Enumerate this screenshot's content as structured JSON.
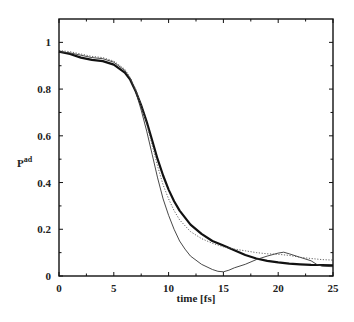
{
  "chart_data": {
    "type": "line",
    "title": "",
    "xlabel": "time [fs]",
    "ylabel": "P",
    "ylabel_superscript": "ad",
    "xlim": [
      0,
      25
    ],
    "ylim": [
      0,
      1.1
    ],
    "xticks": [
      0,
      5,
      10,
      15,
      20,
      25
    ],
    "yticks": [
      0,
      0.2,
      0.4,
      0.6,
      0.8,
      1
    ],
    "xtick_labels": [
      "0",
      "5",
      "10",
      "15",
      "20",
      "25"
    ],
    "ytick_labels": [
      "0",
      "0.2",
      "0.4",
      "0.6",
      "0.8",
      "1"
    ],
    "grid": false,
    "legend": null,
    "series": [
      {
        "name": "thick-solid",
        "style": "solid",
        "width": 2.2,
        "color": "#111111",
        "x": [
          0,
          1,
          2,
          3,
          4,
          5,
          6,
          6.5,
          7,
          7.5,
          8,
          8.5,
          9,
          9.5,
          10,
          10.5,
          11,
          12,
          13,
          14,
          15,
          16,
          17,
          18,
          19,
          20,
          21,
          22,
          23,
          24,
          25
        ],
        "y": [
          0.96,
          0.95,
          0.935,
          0.925,
          0.92,
          0.905,
          0.87,
          0.84,
          0.79,
          0.73,
          0.66,
          0.58,
          0.5,
          0.43,
          0.37,
          0.32,
          0.28,
          0.22,
          0.18,
          0.15,
          0.13,
          0.11,
          0.09,
          0.075,
          0.065,
          0.058,
          0.053,
          0.05,
          0.048,
          0.047,
          0.046
        ]
      },
      {
        "name": "thin-solid",
        "style": "solid",
        "width": 0.9,
        "color": "#333333",
        "x": [
          0,
          1,
          2,
          3,
          4,
          5,
          6,
          6.5,
          7,
          7.5,
          8,
          8.5,
          9,
          9.5,
          10,
          10.5,
          11,
          11.5,
          12,
          13,
          14,
          14.5,
          15,
          15.5,
          16,
          17,
          18,
          19,
          20,
          20.5,
          21,
          22,
          23,
          23.5,
          24,
          25
        ],
        "y": [
          0.96,
          0.955,
          0.945,
          0.935,
          0.93,
          0.915,
          0.88,
          0.845,
          0.79,
          0.71,
          0.62,
          0.52,
          0.42,
          0.33,
          0.26,
          0.2,
          0.15,
          0.115,
          0.085,
          0.05,
          0.028,
          0.02,
          0.018,
          0.025,
          0.035,
          0.05,
          0.07,
          0.085,
          0.098,
          0.102,
          0.095,
          0.08,
          0.065,
          0.05,
          0.042,
          0.04
        ]
      },
      {
        "name": "dotted",
        "style": "dotted",
        "width": 0.9,
        "color": "#555555",
        "x": [
          0,
          1,
          2,
          3,
          4,
          5,
          6,
          6.5,
          7,
          7.5,
          8,
          8.5,
          9,
          9.5,
          10,
          10.5,
          11,
          12,
          13,
          14,
          15,
          16,
          17,
          18,
          19,
          20,
          21,
          22,
          23,
          24,
          25
        ],
        "y": [
          0.965,
          0.96,
          0.95,
          0.94,
          0.935,
          0.92,
          0.885,
          0.85,
          0.8,
          0.73,
          0.65,
          0.56,
          0.47,
          0.39,
          0.33,
          0.28,
          0.24,
          0.19,
          0.16,
          0.14,
          0.125,
          0.115,
          0.108,
          0.1,
          0.095,
          0.093,
          0.088,
          0.08,
          0.075,
          0.07,
          0.068
        ]
      }
    ]
  }
}
